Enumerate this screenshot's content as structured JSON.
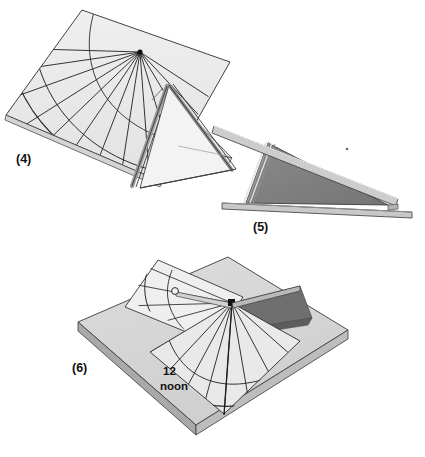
{
  "page": {
    "background_color": "#ffffff",
    "width": 425,
    "height": 457
  },
  "palette": {
    "paper_light": "#e8e8e8",
    "paper_lighter": "#efefef",
    "plate_gray": "#d0d0d0",
    "plate_edge_gray": "#9a9a9a",
    "shade_mid_gray": "#808080",
    "shade_dark_gray": "#6e6e6e",
    "edge_dark": "#555555",
    "line_ink": "#1a1a1a",
    "hairline": "#404040"
  },
  "figures": [
    {
      "id": "figure-4",
      "label": "(4)",
      "label_pos": {
        "x": 16,
        "y": 163
      },
      "caption_role": "folded dial face with hour lines",
      "description": "Flat sheet folded along a ridge, printed with radiating hour lines and two arcs, with a triangular gnomon folded up on the right"
    },
    {
      "id": "figure-5",
      "label": "(5)",
      "label_pos": {
        "x": 253,
        "y": 231
      },
      "caption_role": "side elevation of assembled gnomon",
      "description": "Side view showing the dark triangular gnomon standing on the base strip"
    },
    {
      "id": "figure-6",
      "label": "(6)",
      "label_pos": {
        "x": 72,
        "y": 372
      },
      "caption_role": "finished sundial on base board",
      "description": "Completed sundial mounted on a square baseboard, casting a shadow, with the noon line marked"
    }
  ],
  "annotations": {
    "noon_line": {
      "line1": "12",
      "line2": "noon",
      "pos": {
        "x": 163,
        "y": 375
      }
    }
  },
  "hour_lines": {
    "count": 13,
    "center_note": "all hour lines radiate from the gnomon root point"
  }
}
